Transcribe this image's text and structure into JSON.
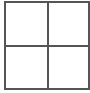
{
  "figure": {
    "type": "grid",
    "rows": 2,
    "columns": 2,
    "cells": [
      {
        "row": 0,
        "col": 0,
        "text": ""
      },
      {
        "row": 0,
        "col": 1,
        "text": ""
      },
      {
        "row": 1,
        "col": 0,
        "text": ""
      },
      {
        "row": 1,
        "col": 1,
        "text": ""
      }
    ],
    "line_color": "#555555",
    "background": "#ffffff"
  }
}
